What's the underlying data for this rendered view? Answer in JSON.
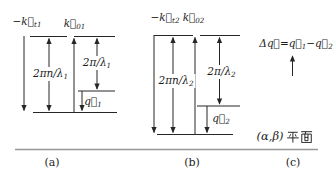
{
  "figure": {
    "captions": {
      "a": "(a)",
      "b": "(b)",
      "c": "(c)"
    },
    "plane": {
      "label": "(α,β) 平面",
      "latin": "(α,β)",
      "cjk": "平面"
    },
    "labels": {
      "a_neg_kt": [
        {
          "t": "−k⃗"
        },
        {
          "t": "t1",
          "sub": true
        }
      ],
      "a_k0": [
        {
          "t": "k⃗"
        },
        {
          "t": "01",
          "sub": true
        }
      ],
      "a_2pin": [
        {
          "t": "2πn/λ"
        },
        {
          "t": "1",
          "sub": true
        }
      ],
      "a_2pi": [
        {
          "t": "2π/λ"
        },
        {
          "t": "1",
          "sub": true
        }
      ],
      "a_q": [
        {
          "t": "q⃗"
        },
        {
          "t": "1",
          "sub": true
        }
      ],
      "b_neg_kt": [
        {
          "t": "−k⃗"
        },
        {
          "t": "t2",
          "sub": true
        }
      ],
      "b_k0": [
        {
          "t": "k⃗"
        },
        {
          "t": "02",
          "sub": true
        }
      ],
      "b_2pin": [
        {
          "t": "2πn/λ"
        },
        {
          "t": "2",
          "sub": true
        }
      ],
      "b_2pi": [
        {
          "t": "2π/λ"
        },
        {
          "t": "2",
          "sub": true
        }
      ],
      "b_q": [
        {
          "t": "q⃗"
        },
        {
          "t": "2",
          "sub": true
        }
      ],
      "c_delta": [
        {
          "t": "Δq⃗=q⃗"
        },
        {
          "t": "1",
          "sub": true
        },
        {
          "t": "−q⃗"
        },
        {
          "t": "2",
          "sub": true
        }
      ]
    },
    "colors": {
      "ink": "#1c1c1c",
      "line": "#262626",
      "baseline": "#979797",
      "bg": "#ffffff"
    }
  }
}
